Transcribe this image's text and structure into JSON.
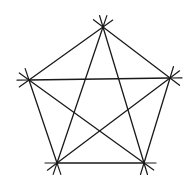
{
  "diagram": {
    "stroke_color": "#1a1a1a",
    "background": "#ffffff",
    "vertices": {
      "top": [
        103,
        27
      ],
      "left": [
        29,
        80
      ],
      "right": [
        170,
        78
      ],
      "bottom_left": [
        57,
        163
      ],
      "bottom_right": [
        144,
        163
      ]
    },
    "sides": [
      {
        "name": "top-left",
        "from": "top",
        "to": "left"
      },
      {
        "name": "top-right",
        "from": "top",
        "to": "right"
      },
      {
        "name": "left-bottom-left",
        "from": "left",
        "to": "bottom_left"
      },
      {
        "name": "right-bottom-right",
        "from": "right",
        "to": "bottom_right"
      },
      {
        "name": "bottom",
        "from": "bottom_left",
        "to": "bottom_right"
      }
    ],
    "diagonals": [
      {
        "name": "left-right",
        "from": "left",
        "to": "right"
      },
      {
        "name": "top-bottom-left",
        "from": "top",
        "to": "bottom_left"
      },
      {
        "name": "top-bottom-right",
        "from": "top",
        "to": "bottom_right"
      },
      {
        "name": "left-bottom-right",
        "from": "left",
        "to": "bottom_right"
      },
      {
        "name": "right-bottom-left",
        "from": "right",
        "to": "bottom_left"
      }
    ],
    "extension_length": 12
  }
}
